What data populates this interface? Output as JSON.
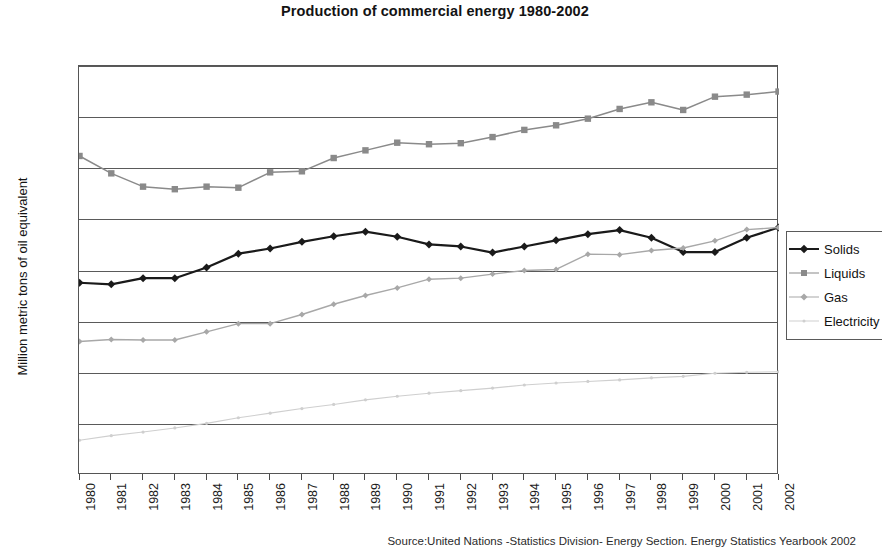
{
  "chart_data": {
    "type": "line",
    "title": "Production of commercial energy 1980-2002",
    "xlabel": "",
    "ylabel": "Million metric tons of oil equivalent",
    "ylim": [
      0,
      4000
    ],
    "ytick_step": 500,
    "yticks": [
      0,
      500,
      1000,
      1500,
      2000,
      2500,
      3000,
      3500,
      4000
    ],
    "grid": true,
    "legend_position": "right",
    "categories": [
      "1980",
      "1981",
      "1982",
      "1983",
      "1984",
      "1985",
      "1986",
      "1987",
      "1988",
      "1989",
      "1990",
      "1991",
      "1992",
      "1993",
      "1994",
      "1995",
      "1996",
      "1997",
      "1998",
      "1999",
      "2000",
      "2001",
      "2002"
    ],
    "series": [
      {
        "name": "Solids",
        "color": "#1a1a1a",
        "marker": "diamond",
        "values": [
          1880,
          1865,
          1925,
          1925,
          2030,
          2165,
          2215,
          2280,
          2335,
          2380,
          2330,
          2255,
          2235,
          2175,
          2235,
          2295,
          2355,
          2395,
          2320,
          2180,
          2180,
          2320,
          2420
        ]
      },
      {
        "name": "Liquids",
        "color": "#8a8a8a",
        "marker": "square",
        "values": [
          3120,
          2950,
          2820,
          2795,
          2820,
          2810,
          2960,
          2970,
          3100,
          3175,
          3250,
          3235,
          3245,
          3305,
          3375,
          3420,
          3485,
          3580,
          3645,
          3570,
          3700,
          3720,
          3750
        ]
      },
      {
        "name": "Gas",
        "color": "#a8a8a8",
        "marker": "diamond-small",
        "values": [
          1305,
          1325,
          1320,
          1320,
          1400,
          1480,
          1480,
          1570,
          1670,
          1755,
          1830,
          1915,
          1925,
          1965,
          2000,
          2010,
          2160,
          2155,
          2195,
          2220,
          2290,
          2400,
          2420
        ]
      },
      {
        "name": "Electricity",
        "color": "#cfcfcf",
        "marker": "dot",
        "values": [
          340,
          385,
          420,
          460,
          505,
          560,
          605,
          650,
          690,
          735,
          770,
          800,
          825,
          850,
          880,
          900,
          915,
          930,
          950,
          965,
          995,
          1005,
          1010
        ]
      }
    ],
    "source": "Source:United Nations -Statistics Division- Energy Section. Energy Statistics Yearbook 2002"
  }
}
